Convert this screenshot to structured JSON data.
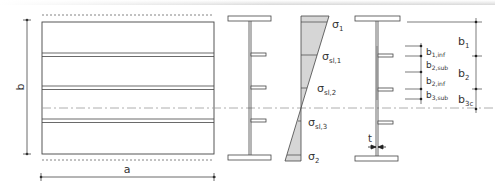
{
  "diagram": {
    "plate_view": {
      "dimension_width": "a",
      "dimension_height": "b",
      "stiffener_count": 3
    },
    "stress_diagram": {
      "labels": [
        {
          "base": "σ",
          "sub": "1"
        },
        {
          "base": "σ",
          "sub": "sl,1"
        },
        {
          "base": "σ",
          "sub": "sl,2"
        },
        {
          "base": "σ",
          "sub": "sl,3"
        },
        {
          "base": "σ",
          "sub": "2"
        }
      ]
    },
    "section_view": {
      "thickness_label": "t",
      "subpanel_labels": [
        {
          "base": "b",
          "sub": "1,inf"
        },
        {
          "base": "b",
          "sub": "2,sub"
        },
        {
          "base": "b",
          "sub": "2,inf"
        },
        {
          "base": "b",
          "sub": "3,sub"
        }
      ],
      "panel_labels": [
        {
          "base": "b",
          "sub": "1"
        },
        {
          "base": "b",
          "sub": "2"
        },
        {
          "base": "b",
          "sub": "3c"
        }
      ]
    },
    "colors": {
      "line": "#444444",
      "fill_stress": "#d6d6d6",
      "axis": "#9a9a9a"
    }
  }
}
